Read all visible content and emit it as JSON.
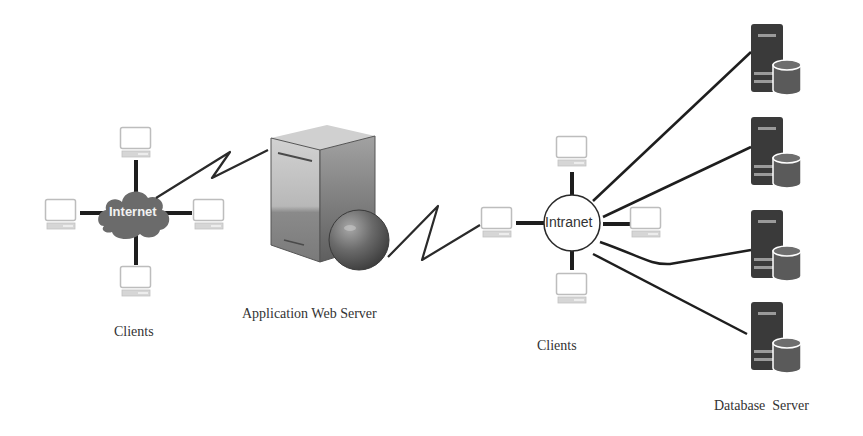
{
  "diagram": {
    "type": "network-architecture",
    "labels": {
      "left_clients": "Clients",
      "app_server": "Application Web Server",
      "right_clients": "Clients",
      "db_server": "Database  Server"
    },
    "hubs": {
      "internet": {
        "label": "Internet",
        "shape": "cloud",
        "color": "#6b6b6b",
        "text_color": "#f2f2f2"
      },
      "intranet": {
        "label": "Intranet",
        "shape": "circle",
        "color": "#ffffff",
        "text_color": "#333333"
      }
    },
    "nodes": {
      "internet_clients": [
        "client-top",
        "client-left",
        "client-right",
        "client-bottom"
      ],
      "intranet_clients": [
        "client-top",
        "client-left",
        "client-right",
        "client-bottom"
      ],
      "app_server": {
        "icon": "server-tower-with-globe-icon"
      },
      "database_servers": [
        "db-server-1",
        "db-server-2",
        "db-server-3",
        "db-server-4"
      ]
    },
    "edges": [
      {
        "from": "internet",
        "to": "app_server",
        "style": "lightning-zigzag"
      },
      {
        "from": "app_server",
        "to": "intranet-client-left",
        "style": "lightning-zigzag"
      },
      {
        "from": "intranet",
        "to": "db-server-1",
        "style": "line"
      },
      {
        "from": "intranet",
        "to": "db-server-2",
        "style": "line"
      },
      {
        "from": "intranet",
        "to": "db-server-3",
        "style": "line"
      },
      {
        "from": "intranet",
        "to": "db-server-4",
        "style": "line"
      }
    ],
    "colors": {
      "line": "#2a2a2a",
      "client_outline": "#bdbdbd",
      "server_body": "#3a3a3a",
      "db_cylinder": "#555555"
    }
  }
}
